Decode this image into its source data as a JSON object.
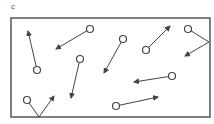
{
  "panel_label": "c",
  "colors": {
    "stroke": "#444444",
    "box": "#555555",
    "circle_fill": "#ffffff"
  },
  "box": {
    "x": 11,
    "y": 18,
    "width": 199,
    "height": 99
  },
  "particle_radius": 3.5,
  "particles": [
    {
      "id": 1,
      "circle": [
        37,
        70
      ],
      "path": [
        [
          37,
          70
        ],
        [
          28,
          31
        ]
      ],
      "arrow_to": [
        28,
        31
      ]
    },
    {
      "id": 2,
      "circle": [
        90,
        29
      ],
      "path": [
        [
          90,
          29
        ],
        [
          56,
          49
        ]
      ],
      "arrow_to": [
        56,
        49
      ]
    },
    {
      "id": 3,
      "circle": [
        123,
        39
      ],
      "path": [
        [
          123,
          39
        ],
        [
          104,
          73
        ]
      ],
      "arrow_to": [
        104,
        73
      ]
    },
    {
      "id": 4,
      "circle": [
        146,
        50
      ],
      "path": [
        [
          146,
          50
        ],
        [
          170,
          26
        ]
      ],
      "arrow_to": [
        170,
        26
      ]
    },
    {
      "id": 5,
      "circle": [
        188,
        29
      ],
      "path": [
        [
          188,
          29
        ],
        [
          209,
          42
        ],
        [
          185,
          56
        ]
      ],
      "arrow_to": [
        185,
        56
      ],
      "reflects_off": "right-wall"
    },
    {
      "id": 6,
      "circle": [
        172,
        76
      ],
      "path": [
        [
          172,
          76
        ],
        [
          134,
          82
        ]
      ],
      "arrow_to": [
        134,
        82
      ]
    },
    {
      "id": 7,
      "circle": [
        116,
        106
      ],
      "path": [
        [
          116,
          106
        ],
        [
          158,
          97
        ]
      ],
      "arrow_to": [
        158,
        97
      ]
    },
    {
      "id": 8,
      "circle": [
        80,
        59
      ],
      "path": [
        [
          80,
          59
        ],
        [
          71,
          98
        ]
      ],
      "arrow_to": [
        71,
        98
      ]
    },
    {
      "id": 9,
      "circle": [
        27,
        100
      ],
      "path": [
        [
          27,
          100
        ],
        [
          39,
          117
        ],
        [
          54,
          96
        ]
      ],
      "arrow_to": [
        54,
        96
      ],
      "reflects_off": "bottom-wall"
    }
  ]
}
